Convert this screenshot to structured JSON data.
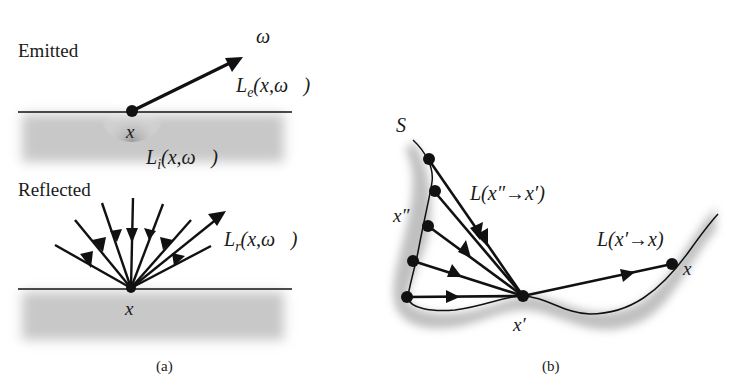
{
  "panel_a": {
    "caption": "(a)",
    "emitted": {
      "title": "Emitted",
      "point_label": "x",
      "direction_label": "ω⃗",
      "emitted_radiance": "L",
      "emitted_sub": "e",
      "emitted_args": "(x,ω⃗)",
      "internal_radiance": "L",
      "internal_sub": "i",
      "internal_args": "(x,ω⃗)"
    },
    "reflected": {
      "title": "Reflected",
      "point_label": "x",
      "reflected_radiance": "L",
      "reflected_sub": "r",
      "reflected_args": "(x,ω⃗)"
    }
  },
  "panel_b": {
    "caption": "(b)",
    "surface_label": "S",
    "source_point_label": "x″",
    "intermediate_point_label": "x′",
    "target_point_label": "x",
    "transport_in_label": "L(x″→x′)",
    "transport_out_label": "L(x′→x)"
  },
  "colors": {
    "ink": "#111111",
    "surface_shade": "#c8c8c8",
    "background": "#ffffff"
  }
}
